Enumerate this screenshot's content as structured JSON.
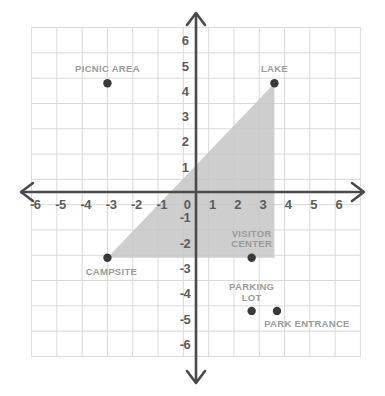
{
  "chart_data": {
    "type": "scatter",
    "title": "",
    "xlabel": "",
    "ylabel": "",
    "xlim": [
      -6.5,
      6.5
    ],
    "ylim": [
      -6.5,
      6.5
    ],
    "grid": true,
    "legend": "none",
    "x_ticks": [
      "-6",
      "-5",
      "-4",
      "-3",
      "-2",
      "-1",
      "0",
      "1",
      "2",
      "3",
      "4",
      "5",
      "6"
    ],
    "y_ticks": [
      "6",
      "5",
      "4",
      "3",
      "2",
      "1",
      "-1",
      "-2",
      "-3",
      "-4",
      "-5",
      "-6"
    ],
    "origin_label": "0",
    "points": [
      {
        "label": "PICNIC AREA",
        "x": -3.5,
        "y": 4.3,
        "label_dx": 0,
        "label_dy": -14,
        "lines": [
          "PICNIC AREA"
        ]
      },
      {
        "label": "LAKE",
        "x": 3.1,
        "y": 4.3,
        "label_dx": 0,
        "label_dy": -14,
        "lines": [
          "LAKE"
        ]
      },
      {
        "label": "CAMPSITE",
        "x": -3.5,
        "y": -2.6,
        "label_dx": 4,
        "label_dy": 14,
        "lines": [
          "CAMPSITE"
        ]
      },
      {
        "label": "VISITOR CENTER",
        "x": 2.2,
        "y": -2.6,
        "label_dx": 0,
        "label_dy": -18,
        "lines": [
          "VISITOR",
          "CENTER"
        ]
      },
      {
        "label": "PARKING LOT",
        "x": 2.2,
        "y": -4.7,
        "label_dx": 0,
        "label_dy": -18,
        "lines": [
          "PARKING",
          "LOT"
        ]
      },
      {
        "label": "PARK ENTRANCE",
        "x": 3.2,
        "y": -4.7,
        "label_dx": 30,
        "label_dy": 13,
        "lines": [
          "PARK ENTRANCE"
        ]
      }
    ],
    "shaded_region": {
      "name": "shaded-triangle",
      "vertices": [
        [
          -3.5,
          -2.6
        ],
        [
          3.1,
          -2.6
        ],
        [
          3.1,
          4.3
        ]
      ],
      "fill": "#c6c6c6",
      "opacity": 0.85
    },
    "colors": {
      "background": "#ffffff",
      "grid_line": "#d9d9d9",
      "axis": "#4a4a4a",
      "tick_text": "#5c5c5c",
      "point_fill": "#3a3a3a",
      "point_label_text": "#9a9a9a",
      "shaded_fill": "#c6c6c6"
    },
    "axis_arrows": [
      "up",
      "down",
      "left",
      "right"
    ]
  }
}
